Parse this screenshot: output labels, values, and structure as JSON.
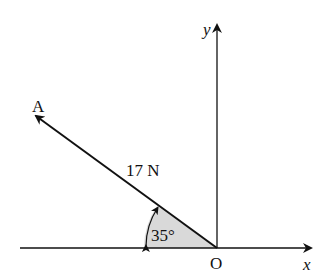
{
  "diagram": {
    "type": "force-vector",
    "origin_label": "O",
    "x_axis_label": "x",
    "y_axis_label": "y",
    "point_label": "A",
    "force_label": "17 N",
    "angle_label": "35°",
    "colors": {
      "line": "#111111",
      "shade": "#d9d9d9",
      "background": "#ffffff"
    }
  }
}
